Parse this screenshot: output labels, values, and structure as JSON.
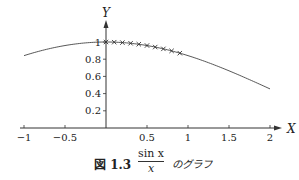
{
  "chart_data": {
    "type": "line",
    "function": "sin(x)/x",
    "xlabel": "X",
    "ylabel": "Y",
    "xlim": [
      -1,
      2
    ],
    "ylim": [
      0,
      1
    ],
    "x_ticks": [
      -1,
      -0.5,
      0.5,
      1,
      1.5,
      2
    ],
    "x_tick_labels": [
      "−1",
      "−0.5",
      "0.5",
      "1",
      "1.5",
      "2"
    ],
    "y_ticks": [
      0.2,
      0.4,
      0.6,
      0.8,
      1
    ],
    "y_tick_labels": [
      "0.2",
      "0.4",
      "0.6",
      "0.8",
      "1"
    ],
    "grid": false,
    "legend": null,
    "series": [
      {
        "name": "sin x / x",
        "style": "line",
        "x": [
          -1.0,
          -0.75,
          -0.5,
          -0.25,
          0,
          0.25,
          0.5,
          0.75,
          1.0,
          1.25,
          1.5,
          1.75,
          2.0
        ],
        "values": [
          0.841,
          0.909,
          0.959,
          0.99,
          1.0,
          0.99,
          0.959,
          0.909,
          0.841,
          0.759,
          0.665,
          0.562,
          0.455
        ]
      },
      {
        "name": "markers",
        "style": "cross",
        "x": [
          0.0,
          0.1,
          0.2,
          0.3,
          0.4,
          0.5,
          0.6,
          0.7,
          0.8,
          0.9
        ],
        "values": [
          1.0,
          0.998,
          0.993,
          0.985,
          0.974,
          0.959,
          0.941,
          0.92,
          0.897,
          0.87
        ]
      }
    ]
  },
  "caption": {
    "figure_label": "図 1.3",
    "numerator": "sin x",
    "denominator": "x",
    "suffix": "のグラフ"
  },
  "axes": {
    "x_label": "X",
    "y_label": "Y"
  }
}
